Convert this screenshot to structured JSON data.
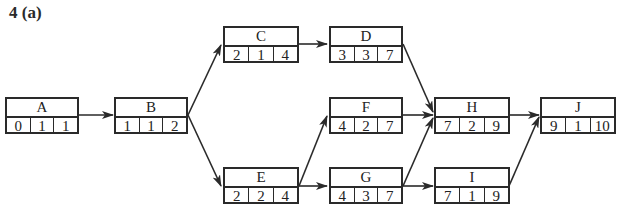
{
  "title": "4 (a)",
  "nodes": {
    "A": {
      "name": "A",
      "values": [
        "0",
        "1",
        "1"
      ]
    },
    "B": {
      "name": "B",
      "values": [
        "1",
        "1",
        "2"
      ]
    },
    "C": {
      "name": "C",
      "values": [
        "2",
        "1",
        "4"
      ]
    },
    "D": {
      "name": "D",
      "values": [
        "3",
        "3",
        "7"
      ]
    },
    "E": {
      "name": "E",
      "values": [
        "2",
        "2",
        "4"
      ]
    },
    "F": {
      "name": "F",
      "values": [
        "4",
        "2",
        "7"
      ]
    },
    "G": {
      "name": "G",
      "values": [
        "4",
        "3",
        "7"
      ]
    },
    "H": {
      "name": "H",
      "values": [
        "7",
        "2",
        "9"
      ]
    },
    "I": {
      "name": "I",
      "values": [
        "7",
        "1",
        "9"
      ]
    },
    "J": {
      "name": "J",
      "values": [
        "9",
        "1",
        "10"
      ]
    }
  },
  "edges": [
    [
      "A",
      "B"
    ],
    [
      "B",
      "C"
    ],
    [
      "B",
      "E"
    ],
    [
      "C",
      "D"
    ],
    [
      "E",
      "F"
    ],
    [
      "E",
      "G"
    ],
    [
      "D",
      "H"
    ],
    [
      "F",
      "H"
    ],
    [
      "G",
      "H"
    ],
    [
      "G",
      "I"
    ],
    [
      "H",
      "J"
    ],
    [
      "I",
      "J"
    ]
  ]
}
